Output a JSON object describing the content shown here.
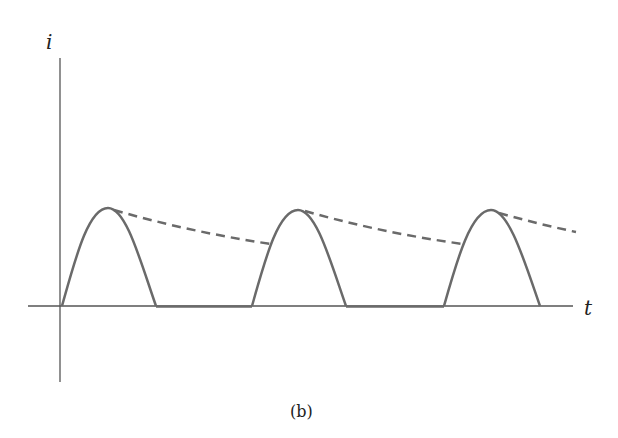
{
  "diagram": {
    "y_axis_label": "i",
    "x_axis_label": "t",
    "caption": "(b)",
    "colors": {
      "axis": "#555555",
      "waveform": "#6a6a6a",
      "envelope": "#6a6a6a"
    },
    "pulses": [
      {
        "start_x": 62,
        "peak_x": 108,
        "end_x": 156
      },
      {
        "start_x": 252,
        "peak_x": 298,
        "end_x": 346
      },
      {
        "start_x": 444,
        "peak_x": 491,
        "end_x": 540
      }
    ]
  }
}
